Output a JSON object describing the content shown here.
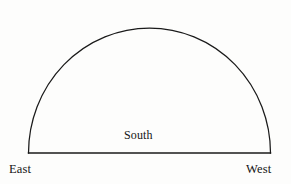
{
  "figure": {
    "background_color": "#fdfdfc",
    "stroke_color": "#1a1a1a",
    "width": 291,
    "height": 184
  },
  "diagram": {
    "shape": "semicircular-dome",
    "horizon": {
      "x_start": 28,
      "x_end": 270,
      "y": 153
    },
    "arc": {
      "apex_x": 149,
      "apex_y": 28,
      "radius_x": 121,
      "radius_y": 125
    }
  },
  "labels": {
    "east": "East",
    "west": "West",
    "south": "South"
  }
}
